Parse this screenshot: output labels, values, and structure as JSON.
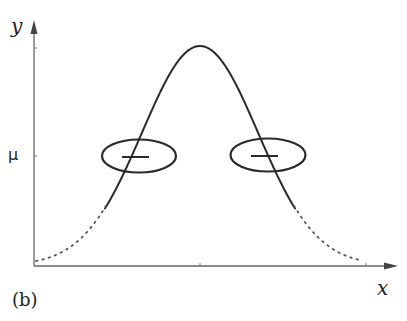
{
  "figure": {
    "panel_label": "(b)",
    "x_axis_label": "x",
    "y_axis_label": "y",
    "y_tick_label": "μ",
    "curve": {
      "type": "bell-curve",
      "style": "stippled"
    },
    "markers": [
      {
        "name": "left-ellipse",
        "shape": "ellipse-with-dash",
        "side": "left"
      },
      {
        "name": "right-ellipse",
        "shape": "ellipse-with-dash",
        "side": "right"
      }
    ],
    "colors": {
      "ink": "#2a2a2a",
      "axis": "#555555",
      "background": "#ffffff"
    }
  }
}
